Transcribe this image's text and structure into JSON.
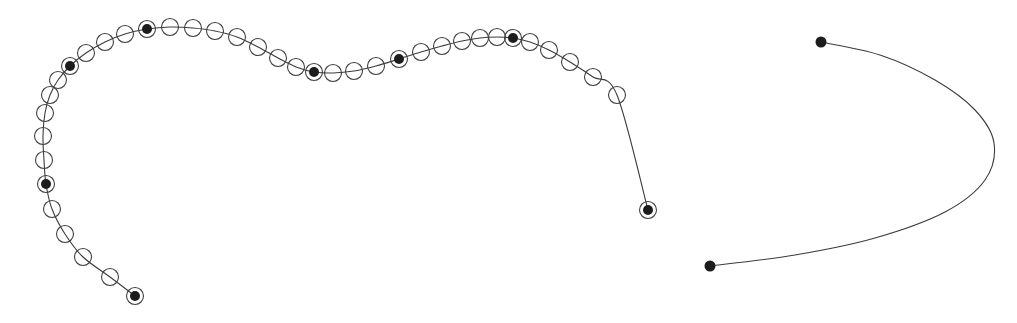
{
  "figure": {
    "title": "",
    "background_color": "#ffffff",
    "width": 1017,
    "height": 323,
    "stroke_color": "#3c3c3c",
    "marker_open_stroke": "#404040",
    "marker_filled_color": "#1c1c1c",
    "line_width": 1.1,
    "marker_open_radius": 8.5,
    "marker_filled_ring_radius": 8.5,
    "marker_filled_core_radius": 5.0,
    "endpoint_dot_radius": 5.5
  },
  "chart_data": {
    "type": "line",
    "title": "",
    "xlabel": "",
    "ylabel": "",
    "xlim": [
      0,
      1017
    ],
    "ylim": [
      0,
      323
    ],
    "grid": false,
    "legend": "none",
    "axis_visible": false,
    "tick_labels": [],
    "annotations": [],
    "series": [
      {
        "name": "curve-with-markers",
        "marker_style": "circle",
        "x": [
          135,
          110,
          83,
          65,
          52,
          46,
          44,
          43,
          45,
          50,
          58,
          70,
          86,
          105,
          125,
          147,
          170,
          193,
          215,
          237,
          258,
          278,
          296,
          314,
          333,
          354,
          376,
          399,
          421,
          442,
          462,
          480,
          497,
          513,
          530,
          549,
          570,
          593,
          617,
          648
        ],
        "y": [
          296,
          277,
          257,
          234,
          209,
          184,
          160,
          136,
          113,
          95,
          80,
          66,
          53,
          42,
          34,
          29,
          27,
          28,
          31,
          37,
          47,
          58,
          67,
          72,
          73,
          71,
          66,
          59,
          52,
          46,
          41,
          38,
          37,
          38,
          42,
          50,
          62,
          77,
          95,
          210
        ],
        "filled_indices": [
          0,
          5,
          11,
          15,
          23,
          27,
          33,
          39
        ],
        "point_count": 40
      },
      {
        "name": "plain-arc",
        "marker_style": "endpoint-dots-only",
        "endpoints": [
          {
            "x": 821,
            "y": 42
          },
          {
            "x": 710,
            "y": 266
          }
        ],
        "apex": {
          "x": 996,
          "y": 143
        },
        "x": [
          821,
          880,
          935,
          975,
          994,
          985,
          945,
          875,
          795,
          710
        ],
        "y": [
          42,
          55,
          80,
          110,
          143,
          180,
          212,
          238,
          255,
          266
        ]
      }
    ]
  },
  "markers": {
    "open_label": "open-circle-marker",
    "filled_label": "filled-circle-marker",
    "endpoint_label": "endpoint-dot-marker"
  }
}
